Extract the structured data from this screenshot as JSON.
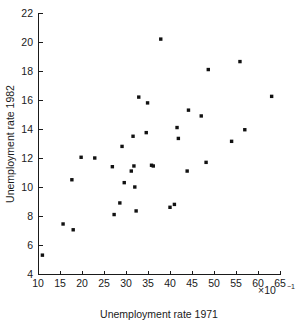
{
  "chart_data": {
    "type": "scatter",
    "title": "",
    "xlabel": "Unemployment rate 1971",
    "ylabel": "Unemployment rate 1982",
    "x_multiplier_label": "×10",
    "x_multiplier_exponent": "−1",
    "xlim": [
      10,
      65
    ],
    "ylim": [
      4,
      22
    ],
    "xticks": [
      10,
      15,
      20,
      25,
      30,
      35,
      40,
      45,
      50,
      55,
      60,
      65
    ],
    "yticks": [
      4,
      6,
      8,
      10,
      12,
      14,
      16,
      18,
      20,
      22
    ],
    "xtick_labels": [
      "10",
      "15",
      "20",
      "25",
      "30",
      "35",
      "40",
      "45",
      "50",
      "55",
      "60",
      "65"
    ],
    "ytick_labels": [
      "4",
      "6",
      "8",
      "10",
      "12",
      "14",
      "16",
      "18",
      "20",
      "22"
    ],
    "grid": false,
    "legend": null,
    "marker_color": "#111111",
    "marker_symbol": "square",
    "points": [
      {
        "x": 11.0,
        "y": 5.3
      },
      {
        "x": 15.7,
        "y": 7.45
      },
      {
        "x": 18.0,
        "y": 7.05
      },
      {
        "x": 17.7,
        "y": 10.5
      },
      {
        "x": 19.8,
        "y": 12.05
      },
      {
        "x": 22.9,
        "y": 12.0
      },
      {
        "x": 26.9,
        "y": 11.4
      },
      {
        "x": 27.3,
        "y": 8.1
      },
      {
        "x": 28.6,
        "y": 8.9
      },
      {
        "x": 29.1,
        "y": 12.8
      },
      {
        "x": 29.6,
        "y": 10.3
      },
      {
        "x": 31.2,
        "y": 11.1
      },
      {
        "x": 31.8,
        "y": 11.45
      },
      {
        "x": 31.6,
        "y": 13.5
      },
      {
        "x": 32.0,
        "y": 10.0
      },
      {
        "x": 32.3,
        "y": 8.35
      },
      {
        "x": 32.9,
        "y": 16.2
      },
      {
        "x": 34.6,
        "y": 13.75
      },
      {
        "x": 34.9,
        "y": 15.8
      },
      {
        "x": 35.8,
        "y": 11.5
      },
      {
        "x": 36.2,
        "y": 11.45
      },
      {
        "x": 37.9,
        "y": 20.2
      },
      {
        "x": 40.0,
        "y": 8.6
      },
      {
        "x": 41.0,
        "y": 8.8
      },
      {
        "x": 41.6,
        "y": 14.1
      },
      {
        "x": 41.9,
        "y": 13.35
      },
      {
        "x": 43.9,
        "y": 11.1
      },
      {
        "x": 44.2,
        "y": 15.3
      },
      {
        "x": 47.1,
        "y": 14.9
      },
      {
        "x": 48.2,
        "y": 11.7
      },
      {
        "x": 48.7,
        "y": 18.1
      },
      {
        "x": 54.0,
        "y": 13.15
      },
      {
        "x": 55.9,
        "y": 18.65
      },
      {
        "x": 57.0,
        "y": 13.95
      },
      {
        "x": 63.1,
        "y": 16.25
      }
    ]
  },
  "axes": {
    "x_axis_name": "x-axis",
    "y_axis_name": "y-axis"
  }
}
